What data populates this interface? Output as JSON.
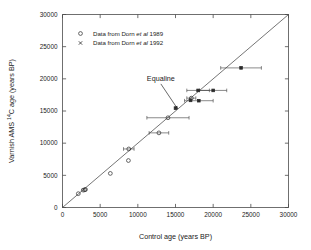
{
  "chart_data": {
    "type": "scatter",
    "title": "",
    "xlabel": "Control age (years BP)",
    "ylabel": "Varnish AMS 14C age (years BP)",
    "ylabel_prefix": "Varnish AMS ",
    "ylabel_superscript": "14",
    "ylabel_suffix": "C age (years BP)",
    "xlim": [
      0,
      30000
    ],
    "ylim": [
      0,
      30000
    ],
    "xticks": [
      0,
      5000,
      10000,
      15000,
      20000,
      25000,
      30000
    ],
    "yticks": [
      0,
      5000,
      10000,
      15000,
      20000,
      25000,
      30000
    ],
    "xticklabels": [
      "0",
      "5000",
      "10000",
      "15000",
      "20000",
      "25000",
      "30000"
    ],
    "yticklabels": [
      "0",
      "5000",
      "10000",
      "15000",
      "20000",
      "25000",
      "30000"
    ],
    "grid": false,
    "legend_position": "upper-left-inside",
    "annotations": [
      {
        "text": "Equaline",
        "text_x": 11200,
        "text_y": 19600,
        "target_x": 15300,
        "target_y": 15300
      }
    ],
    "reference_line": {
      "name": "Equaline",
      "from": [
        0,
        0
      ],
      "to": [
        30000,
        30000
      ]
    },
    "series": [
      {
        "name": "Data from Dorn et al 1989",
        "legend_label_plain": "Data from Dorn ",
        "legend_label_italic": "et al",
        "legend_label_tail": " 1989",
        "marker": "open-circle",
        "points": [
          {
            "x": 2100,
            "y": 2150,
            "xerr": 0
          },
          {
            "x": 2750,
            "y": 2700,
            "xerr": 0
          },
          {
            "x": 2950,
            "y": 2750,
            "xerr": 0
          },
          {
            "x": 3050,
            "y": 2800,
            "xerr": 0
          },
          {
            "x": 6350,
            "y": 5300,
            "xerr": 0
          },
          {
            "x": 8750,
            "y": 7300,
            "xerr": 0
          },
          {
            "x": 8800,
            "y": 9100,
            "xerr": 700
          },
          {
            "x": 12800,
            "y": 11600,
            "xerr": 1300
          },
          {
            "x": 14000,
            "y": 13950,
            "xerr": 2800
          },
          {
            "x": 17100,
            "y": 17000,
            "xerr": 600
          }
        ]
      },
      {
        "name": "Data from Dorn et al 1992",
        "legend_label_plain": "Data from Dorn ",
        "legend_label_italic": "et al",
        "legend_label_tail": " 1992",
        "marker": "filled-dot",
        "points": [
          {
            "x": 15000,
            "y": 15450,
            "xerr": 0
          },
          {
            "x": 17000,
            "y": 16650,
            "xerr": 0
          },
          {
            "x": 18100,
            "y": 16600,
            "xerr": 1900
          },
          {
            "x": 18000,
            "y": 18200,
            "xerr": 1500
          },
          {
            "x": 20000,
            "y": 18200,
            "xerr": 1800
          },
          {
            "x": 23700,
            "y": 21700,
            "xerr": 2700
          }
        ]
      }
    ]
  },
  "legend": {
    "entries": [
      {
        "marker": "open-circle",
        "text_plain": "Data from Dorn ",
        "text_italic": "et al",
        "text_tail": " 1989"
      },
      {
        "marker": "cross",
        "text_plain": "Data from Dorn ",
        "text_italic": "et al",
        "text_tail": " 1992"
      }
    ]
  }
}
